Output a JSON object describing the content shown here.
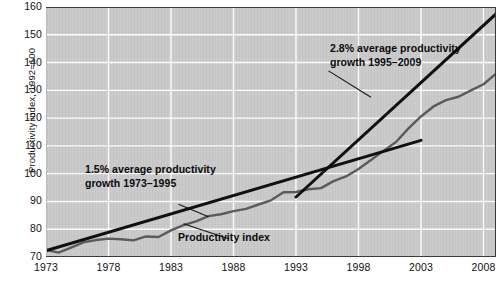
{
  "chart_data": {
    "type": "line",
    "title": "",
    "subtitle": "",
    "xlabel": "",
    "ylabel": "Productivity index, 1992=100",
    "xlim": [
      1973,
      2009
    ],
    "ylim": [
      70,
      160
    ],
    "ytick_values": [
      70,
      80,
      90,
      100,
      110,
      120,
      130,
      140,
      150,
      160
    ],
    "ytick_labels": [
      "70",
      "80",
      "90",
      "100",
      "110",
      "120",
      "130",
      "140",
      "150",
      "160"
    ],
    "xtick_values": [
      1973,
      1978,
      1983,
      1988,
      1993,
      1998,
      2003,
      2008
    ],
    "xtick_labels": [
      "1973",
      "1978",
      "1983",
      "1988",
      "1993",
      "1998",
      "2003",
      "2008"
    ],
    "grid": true,
    "grid_color": "#ffffff",
    "plot_background": "#c9c9c9",
    "legend_position": "none",
    "series": [
      {
        "name": "Productivity index",
        "type": "line",
        "color": "#5b5b5b",
        "width": 2.4,
        "x": [
          1973,
          1974,
          1975,
          1976,
          1977,
          1978,
          1979,
          1980,
          1981,
          1982,
          1983,
          1984,
          1985,
          1986,
          1987,
          1988,
          1989,
          1990,
          1991,
          1992,
          1993,
          1994,
          1995,
          1996,
          1997,
          1998,
          1999,
          2000,
          2001,
          2002,
          2003,
          2004,
          2005,
          2006,
          2007,
          2008,
          2009
        ],
        "values": [
          72.6,
          71.6,
          73.4,
          75.3,
          76.1,
          76.6,
          76.4,
          76.0,
          77.4,
          77.2,
          79.6,
          81.5,
          82.8,
          84.7,
          85.4,
          86.5,
          87.3,
          88.9,
          90.4,
          93.3,
          93.4,
          94.4,
          94.8,
          97.3,
          99.0,
          101.7,
          104.9,
          108.2,
          111.4,
          116.3,
          120.6,
          124.2,
          126.5,
          127.7,
          130.0,
          132.2,
          136.0
        ]
      },
      {
        "name": "1.5% trend 1973-1995",
        "type": "trendline",
        "color": "#111111",
        "width": 3.0,
        "x": [
          1973,
          2003
        ],
        "values": [
          72.3,
          112.0
        ],
        "growth_rate": "1.5%",
        "period": "1973–1995"
      },
      {
        "name": "2.8% trend 1995-2009",
        "type": "trendline",
        "color": "#111111",
        "width": 3.0,
        "x": [
          1993,
          2009
        ],
        "values": [
          91.6,
          157.5
        ],
        "growth_rate": "2.8%",
        "period": "1995–2009"
      }
    ],
    "annotations": [
      {
        "name": "new-growth-annotation",
        "lines": [
          "2.8% average productivity",
          "growth 1995–2009"
        ],
        "leader_from": [
          1995.6,
          137.0
        ],
        "leader_to": [
          1999.0,
          127.5
        ]
      },
      {
        "name": "old-growth-annotation",
        "lines": [
          "1.5% average productivity",
          "growth 1973–1995"
        ],
        "leader_from": [
          1983.6,
          89.0
        ],
        "leader_to": [
          1986.0,
          84.5
        ]
      },
      {
        "name": "series-label-annotation",
        "lines": [
          "Productivity index"
        ],
        "leader_from": [
          1987.6,
          76.6
        ],
        "leader_to": [
          1984.0,
          82.0
        ]
      }
    ]
  },
  "axes": {
    "y_title": "Productivity index, 1992=100",
    "y_ticks": [
      "160",
      "150",
      "140",
      "130",
      "120",
      "110",
      "100",
      "90",
      "80",
      "70"
    ],
    "x_ticks": [
      "1973",
      "1978",
      "1983",
      "1988",
      "1993",
      "1998",
      "2003",
      "2008"
    ]
  },
  "annotations": {
    "new_growth_line1": "2.8% average productivity",
    "new_growth_line2": "growth 1995–2009",
    "old_growth_line1": "1.5% average productivity",
    "old_growth_line2": "growth 1973–1995",
    "series_label": "Productivity index"
  }
}
